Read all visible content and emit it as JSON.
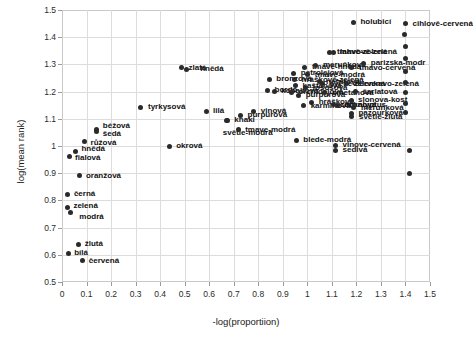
{
  "chart_data": {
    "type": "scatter",
    "title": "",
    "xlabel": "-log(proportiion)",
    "ylabel": "log(mean rank)",
    "xlim": [
      0,
      1.5
    ],
    "ylim": [
      0.5,
      1.5
    ],
    "xticks": [
      "0",
      "0.1",
      "0.2",
      "0.3",
      "0.4",
      "0.5",
      "0.6",
      "0.7",
      "0.8",
      "0.9",
      "1",
      "1.1",
      "1.2",
      "1.3",
      "1.4",
      "1.5"
    ],
    "yticks": [
      "0.5",
      "0.6",
      "0.7",
      "0.8",
      "0.9",
      "1",
      "1.1",
      "1.2",
      "1.3",
      "1.4",
      "1.5"
    ],
    "grid": true,
    "legend": "none",
    "marker_color": "#2a2a2a",
    "points": [
      {
        "label": "bílá",
        "x": 0.025,
        "y": 0.605,
        "lx": 6,
        "ly": 0
      },
      {
        "label": "žlutá",
        "x": 0.068,
        "y": 0.638,
        "lx": 6,
        "ly": 0
      },
      {
        "label": "červená",
        "x": 0.085,
        "y": 0.578,
        "lx": 6,
        "ly": 0
      },
      {
        "label": "zelená",
        "x": 0.022,
        "y": 0.775,
        "lx": 6,
        "ly": -1
      },
      {
        "label": "modrá",
        "x": 0.034,
        "y": 0.757,
        "lx": 9,
        "ly": 5
      },
      {
        "label": "černá",
        "x": 0.024,
        "y": 0.822,
        "lx": 6,
        "ly": 0
      },
      {
        "label": "oranžová",
        "x": 0.073,
        "y": 0.89,
        "lx": 6,
        "ly": 0
      },
      {
        "label": "fialová",
        "x": 0.029,
        "y": 0.962,
        "lx": 6,
        "ly": 2
      },
      {
        "label": "hnědá",
        "x": 0.055,
        "y": 0.98,
        "lx": 6,
        "ly": -2
      },
      {
        "label": "růžová",
        "x": 0.092,
        "y": 1.018,
        "lx": 6,
        "ly": 2
      },
      {
        "label": "šedá",
        "x": 0.142,
        "y": 1.052,
        "lx": 6,
        "ly": 2
      },
      {
        "label": "béžová",
        "x": 0.142,
        "y": 1.06,
        "lx": 6,
        "ly": -4
      },
      {
        "label": "okrová",
        "x": 0.437,
        "y": 1.0,
        "lx": 7,
        "ly": 0
      },
      {
        "label": "tyrkysová",
        "x": 0.322,
        "y": 1.142,
        "lx": 7,
        "ly": 0
      },
      {
        "label": "zlatá",
        "x": 0.487,
        "y": 1.287,
        "lx": 7,
        "ly": 0
      },
      {
        "label": "hnědá",
        "x": 0.506,
        "y": 1.283,
        "lx": 14,
        "ly": 0
      },
      {
        "label": "lilá",
        "x": 0.587,
        "y": 1.127,
        "lx": 7,
        "ly": 0
      },
      {
        "label": "khaki",
        "x": 0.674,
        "y": 1.095,
        "lx": 7,
        "ly": 0
      },
      {
        "label": "světle-modrá",
        "x": 0.672,
        "y": 1.093,
        "lx": -4,
        "ly": 12
      },
      {
        "label": "purpurová",
        "x": 0.728,
        "y": 1.113,
        "lx": 7,
        "ly": 0
      },
      {
        "label": "vinová",
        "x": 0.782,
        "y": 1.128,
        "lx": 7,
        "ly": 0
      },
      {
        "label": "tmave-modrá",
        "x": 0.718,
        "y": 1.06,
        "lx": 7,
        "ly": 0
      },
      {
        "label": "bronzová",
        "x": 0.845,
        "y": 1.245,
        "lx": 7,
        "ly": 0
      },
      {
        "label": "bordó",
        "x": 0.838,
        "y": 1.205,
        "lx": 7,
        "ly": 0
      },
      {
        "label": "kobaltová",
        "x": 0.865,
        "y": 1.202,
        "lx": 7,
        "ly": 0
      },
      {
        "label": "petrolejová",
        "x": 0.945,
        "y": 1.268,
        "lx": 7,
        "ly": 0
      },
      {
        "label": "hráškově-zelená",
        "x": 0.948,
        "y": 1.243,
        "lx": 7,
        "ly": 0
      },
      {
        "label": "kaštanová",
        "x": 0.952,
        "y": 1.222,
        "lx": 7,
        "ly": 0
      },
      {
        "label": "orchidejová",
        "x": 0.935,
        "y": 1.198,
        "lx": 7,
        "ly": 0
      },
      {
        "label": "purpurová",
        "x": 0.965,
        "y": 1.186,
        "lx": 7,
        "ly": 0
      },
      {
        "label": "tmavě-hnědá",
        "x": 0.99,
        "y": 1.29,
        "lx": 7,
        "ly": 0
      },
      {
        "label": "lososová",
        "x": 0.994,
        "y": 1.215,
        "lx": 7,
        "ly": 0
      },
      {
        "label": "tmavě-modrá",
        "x": 1.002,
        "y": 1.262,
        "lx": 7,
        "ly": 0
      },
      {
        "label": "meruňková",
        "x": 1.035,
        "y": 1.296,
        "lx": 7,
        "ly": 0
      },
      {
        "label": "nefritová",
        "x": 1.048,
        "y": 1.237,
        "lx": 7,
        "ly": 0
      },
      {
        "label": "smetanová",
        "x": 1.072,
        "y": 1.196,
        "lx": 7,
        "ly": 0
      },
      {
        "label": "světle-cervená",
        "x": 1.062,
        "y": 1.228,
        "lx": 7,
        "ly": 0
      },
      {
        "label": "hrášková",
        "x": 1.018,
        "y": 1.16,
        "lx": 7,
        "ly": 0
      },
      {
        "label": "karmínová",
        "x": 0.985,
        "y": 1.148,
        "lx": 7,
        "ly": 0
      },
      {
        "label": "citronová",
        "x": 1.105,
        "y": 1.152,
        "lx": 7,
        "ly": 0
      },
      {
        "label": "tmavě-zelená",
        "x": 1.092,
        "y": 1.345,
        "lx": 7,
        "ly": 0
      },
      {
        "label": "lahvově-zelená",
        "x": 1.105,
        "y": 1.342,
        "lx": 7,
        "ly": -1
      },
      {
        "label": "tmavo-cervená",
        "x": 1.182,
        "y": 1.288,
        "lx": 7,
        "ly": 0
      },
      {
        "label": "zelenkavo-zelená",
        "x": 1.16,
        "y": 1.228,
        "lx": 7,
        "ly": 0
      },
      {
        "label": "šarlatová",
        "x": 1.196,
        "y": 1.2,
        "lx": 7,
        "ly": 0
      },
      {
        "label": "slonova-kost",
        "x": 1.178,
        "y": 1.168,
        "lx": 7,
        "ly": 0
      },
      {
        "label": "eukalyptus",
        "x": 1.122,
        "y": 1.15,
        "lx": 7,
        "ly": 0
      },
      {
        "label": "meruňková",
        "x": 1.19,
        "y": 1.14,
        "lx": 7,
        "ly": 0
      },
      {
        "label": "pazourková",
        "x": 1.18,
        "y": 1.12,
        "lx": 7,
        "ly": 0
      },
      {
        "label": "světle-žlutá",
        "x": 1.182,
        "y": 1.108,
        "lx": 7,
        "ly": 0
      },
      {
        "label": "parizska-modr",
        "x": 1.23,
        "y": 1.305,
        "lx": 7,
        "ly": 0
      },
      {
        "label": "holubicí",
        "x": 1.188,
        "y": 1.455,
        "lx": 7,
        "ly": 0
      },
      {
        "label": "cihlově-cervená",
        "x": 1.4,
        "y": 1.45,
        "lx": 7,
        "ly": 0
      },
      {
        "label": "blede-modrá",
        "x": 0.955,
        "y": 1.022,
        "lx": 7,
        "ly": 0
      },
      {
        "label": "vinove-cervená",
        "x": 1.115,
        "y": 1.003,
        "lx": 7,
        "ly": 0
      },
      {
        "label": "sedivá",
        "x": 1.115,
        "y": 0.985,
        "lx": 7,
        "ly": 0
      },
      {
        "label": "",
        "x": 1.398,
        "y": 1.41,
        "lx": 0,
        "ly": 0
      },
      {
        "label": "",
        "x": 1.4,
        "y": 1.365,
        "lx": 0,
        "ly": 0
      },
      {
        "label": "",
        "x": 1.402,
        "y": 1.32,
        "lx": 0,
        "ly": 0
      },
      {
        "label": "",
        "x": 1.4,
        "y": 1.275,
        "lx": 0,
        "ly": 0
      },
      {
        "label": "",
        "x": 1.402,
        "y": 1.232,
        "lx": 0,
        "ly": 0
      },
      {
        "label": "",
        "x": 1.4,
        "y": 1.195,
        "lx": 0,
        "ly": 0
      },
      {
        "label": "",
        "x": 1.402,
        "y": 1.158,
        "lx": 0,
        "ly": 0
      },
      {
        "label": "",
        "x": 1.4,
        "y": 1.122,
        "lx": 0,
        "ly": 0
      },
      {
        "label": "",
        "x": 1.415,
        "y": 0.985,
        "lx": 0,
        "ly": 0
      },
      {
        "label": "",
        "x": 1.415,
        "y": 0.9,
        "lx": 0,
        "ly": 0
      }
    ]
  }
}
